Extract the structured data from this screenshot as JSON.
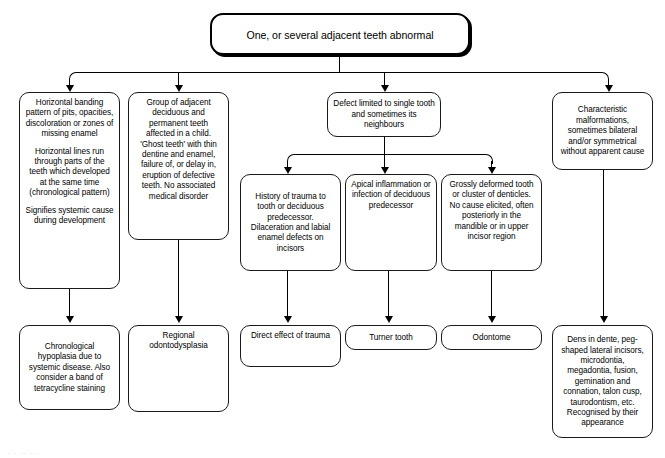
{
  "diagram": {
    "title": "One, or several adjacent teeth abnormal",
    "footer_mark": "· ·    ·· ··"
  },
  "root": {
    "text": "One, or several adjacent teeth abnormal"
  },
  "level1": [
    {
      "id": "horizontal-banding",
      "paragraphs": [
        "Horizontal banding pattern of pits, opacities, discoloration or zones of missing enamel",
        "Horizontal lines run through parts of the teeth which developed at the same time (chronological pattern)",
        "Signifies systemic cause during development"
      ]
    },
    {
      "id": "group-of-adjacent",
      "paragraphs": [
        "Group of adjacent deciduous and permanent teeth affected in a child. 'Ghost teeth' with thin dentine and enamel, failure of, or delay in, eruption of defective teeth. No associated medical disorder"
      ]
    },
    {
      "id": "defect-limited",
      "paragraphs": [
        "Defect limited to single tooth and sometimes its neighbours"
      ]
    },
    {
      "id": "characteristic-malformations",
      "paragraphs": [
        "Characteristic malformations, sometimes bilateral and/or symmetrical without apparent cause"
      ]
    }
  ],
  "level2": [
    {
      "id": "history-of-trauma",
      "paragraphs": [
        "History of trauma to tooth or deciduous predecessor. Dilaceration and labial enamel defects on incisors"
      ]
    },
    {
      "id": "apical-inflammation",
      "paragraphs": [
        "Apical inflammation or infection of deciduous predecessor"
      ]
    },
    {
      "id": "grossly-deformed",
      "paragraphs": [
        "Grossly deformed tooth or cluster of denticles. No cause elicited, often posteriorly in the mandible or in upper incisor region"
      ]
    }
  ],
  "outcomes": [
    {
      "id": "chronological-hypoplasia",
      "paragraphs": [
        "Chronological hypoplasia due to systemic disease. Also consider a band of tetracycline staining"
      ]
    },
    {
      "id": "regional-odontodysplasia",
      "paragraphs": [
        "Regional odontodysplasia"
      ]
    },
    {
      "id": "direct-effect-of-trauma",
      "paragraphs": [
        "Direct effect of trauma"
      ]
    },
    {
      "id": "turner-tooth",
      "paragraphs": [
        "Turner tooth"
      ]
    },
    {
      "id": "odontome",
      "paragraphs": [
        "Odontome"
      ]
    },
    {
      "id": "dens-in-dente",
      "paragraphs": [
        "Dens in dente, peg-shaped lateral incisors, microdontia, megadontia, fusion, gemination and connation, talon cusp, taurodontism, etc. Recognised by their appearance"
      ]
    }
  ]
}
